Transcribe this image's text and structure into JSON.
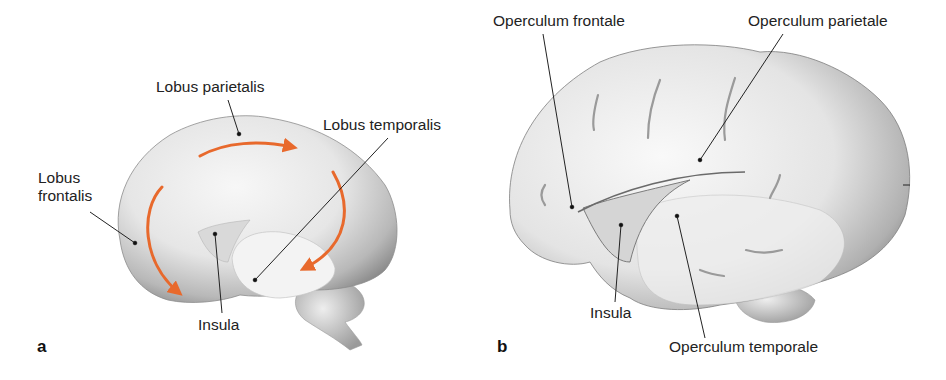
{
  "panels": [
    {
      "id": "a",
      "letter": "a",
      "labels": {
        "lobus_parietalis": "Lobus parietalis",
        "lobus_temporalis": "Lobus temporalis",
        "lobus_frontalis_line1": "Lobus",
        "lobus_frontalis_line2": "frontalis",
        "insula": "Insula"
      },
      "arrow_color": "#e8692c"
    },
    {
      "id": "b",
      "letter": "b",
      "labels": {
        "operculum_frontale": "Operculum frontale",
        "operculum_parietale": "Operculum parietale",
        "insula": "Insula",
        "operculum_temporale": "Operculum temporale"
      }
    }
  ]
}
